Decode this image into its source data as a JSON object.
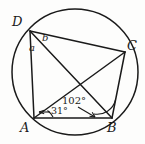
{
  "figure": {
    "stroke_color": "#1a1a1a",
    "background_color": "#fdfdfc",
    "circle": {
      "cx": 75,
      "cy": 72,
      "r": 63
    },
    "vertices": [
      {
        "id": "D",
        "label": "D",
        "x": 30,
        "y": 31,
        "label_x": 12,
        "label_y": 15
      },
      {
        "id": "C",
        "label": "C",
        "x": 125,
        "y": 52,
        "label_x": 127,
        "label_y": 39
      },
      {
        "id": "B",
        "label": "B",
        "x": 112,
        "y": 118,
        "label_x": 107,
        "label_y": 121
      },
      {
        "id": "A",
        "label": "A",
        "x": 34,
        "y": 118,
        "label_x": 20,
        "label_y": 121
      }
    ],
    "segment_labels": [
      {
        "id": "a",
        "label": "a",
        "x": 29,
        "y": 43
      },
      {
        "id": "b",
        "label": "b",
        "x": 42,
        "y": 33
      }
    ],
    "angle_labels": [
      {
        "id": "angle-102",
        "label": "102°",
        "x": 62,
        "y": 96,
        "vertex": "B"
      },
      {
        "id": "angle-31",
        "label": "31°",
        "x": 51,
        "y": 106,
        "vertex": "A"
      }
    ]
  }
}
